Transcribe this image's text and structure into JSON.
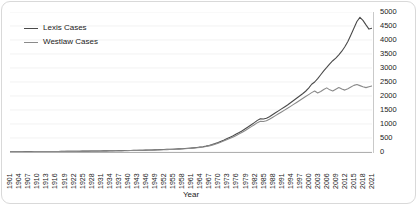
{
  "chart_data": {
    "type": "line",
    "title": "",
    "xlabel": "Year",
    "ylabel": "",
    "ylim": [
      0,
      5000
    ],
    "ytick_step": 500,
    "yticks": [
      0,
      500,
      1000,
      1500,
      2000,
      2500,
      3000,
      3500,
      4000,
      4500,
      5000
    ],
    "y_axis_position": "right",
    "grid": "horizontal",
    "legend_position": "top-left",
    "xlim": [
      1901,
      2021
    ],
    "xtick_step": 3,
    "xticks": [
      1901,
      1904,
      1907,
      1910,
      1913,
      1916,
      1919,
      1922,
      1925,
      1928,
      1931,
      1934,
      1937,
      1940,
      1943,
      1946,
      1949,
      1952,
      1955,
      1958,
      1961,
      1964,
      1967,
      1970,
      1973,
      1976,
      1979,
      1982,
      1985,
      1988,
      1991,
      1994,
      1997,
      2000,
      2003,
      2006,
      2009,
      2012,
      2015,
      2018,
      2021
    ],
    "x": [
      1901,
      1902,
      1903,
      1904,
      1905,
      1906,
      1907,
      1908,
      1909,
      1910,
      1911,
      1912,
      1913,
      1914,
      1915,
      1916,
      1917,
      1918,
      1919,
      1920,
      1921,
      1922,
      1923,
      1924,
      1925,
      1926,
      1927,
      1928,
      1929,
      1930,
      1931,
      1932,
      1933,
      1934,
      1935,
      1936,
      1937,
      1938,
      1939,
      1940,
      1941,
      1942,
      1943,
      1944,
      1945,
      1946,
      1947,
      1948,
      1949,
      1950,
      1951,
      1952,
      1953,
      1954,
      1955,
      1956,
      1957,
      1958,
      1959,
      1960,
      1961,
      1962,
      1963,
      1964,
      1965,
      1966,
      1967,
      1968,
      1969,
      1970,
      1971,
      1972,
      1973,
      1974,
      1975,
      1976,
      1977,
      1978,
      1979,
      1980,
      1981,
      1982,
      1983,
      1984,
      1985,
      1986,
      1987,
      1988,
      1989,
      1990,
      1991,
      1992,
      1993,
      1994,
      1995,
      1996,
      1997,
      1998,
      1999,
      2000,
      2001,
      2002,
      2003,
      2004,
      2005,
      2006,
      2007,
      2008,
      2009,
      2010,
      2011,
      2012,
      2013,
      2014,
      2015,
      2016,
      2017,
      2018,
      2019,
      2020,
      2021
    ],
    "series": [
      {
        "name": "Lexis Cases",
        "color": "#4a4a4a",
        "values": [
          8,
          9,
          10,
          10,
          11,
          12,
          12,
          13,
          14,
          15,
          15,
          16,
          17,
          18,
          19,
          20,
          20,
          21,
          22,
          24,
          25,
          26,
          27,
          28,
          30,
          31,
          32,
          34,
          35,
          37,
          38,
          40,
          41,
          43,
          45,
          46,
          48,
          50,
          52,
          54,
          56,
          58,
          60,
          62,
          65,
          68,
          70,
          73,
          76,
          80,
          84,
          88,
          92,
          96,
          100,
          106,
          112,
          118,
          125,
          132,
          140,
          150,
          162,
          175,
          190,
          210,
          235,
          265,
          300,
          340,
          385,
          430,
          480,
          530,
          580,
          640,
          700,
          760,
          830,
          900,
          975,
          1050,
          1130,
          1190,
          1180,
          1205,
          1260,
          1330,
          1400,
          1470,
          1540,
          1610,
          1680,
          1760,
          1840,
          1920,
          2000,
          2080,
          2170,
          2280,
          2420,
          2500,
          2620,
          2760,
          2900,
          3020,
          3150,
          3260,
          3350,
          3470,
          3600,
          3760,
          3950,
          4180,
          4420,
          4660,
          4810,
          4700,
          4540,
          4390,
          4420
        ]
      },
      {
        "name": "Westlaw Cases",
        "color": "#8a8a8a",
        "values": [
          6,
          7,
          8,
          8,
          9,
          10,
          10,
          11,
          12,
          13,
          13,
          14,
          15,
          16,
          17,
          17,
          18,
          19,
          20,
          21,
          22,
          23,
          24,
          25,
          26,
          27,
          29,
          30,
          31,
          33,
          34,
          36,
          37,
          39,
          40,
          42,
          44,
          46,
          47,
          49,
          51,
          53,
          55,
          57,
          60,
          62,
          65,
          68,
          70,
          74,
          78,
          82,
          86,
          90,
          94,
          99,
          104,
          110,
          116,
          123,
          130,
          140,
          152,
          164,
          178,
          196,
          218,
          245,
          278,
          315,
          355,
          398,
          444,
          490,
          538,
          592,
          648,
          706,
          770,
          836,
          905,
          975,
          1048,
          1100,
          1090,
          1115,
          1170,
          1235,
          1300,
          1365,
          1430,
          1495,
          1560,
          1630,
          1700,
          1770,
          1840,
          1910,
          1980,
          2050,
          2120,
          2180,
          2110,
          2160,
          2230,
          2290,
          2220,
          2180,
          2240,
          2300,
          2250,
          2210,
          2260,
          2320,
          2380,
          2410,
          2370,
          2330,
          2300,
          2330,
          2360
        ]
      }
    ]
  },
  "legend": {
    "items": [
      {
        "label": "Lexis Cases"
      },
      {
        "label": "Westlaw Cases"
      }
    ]
  }
}
